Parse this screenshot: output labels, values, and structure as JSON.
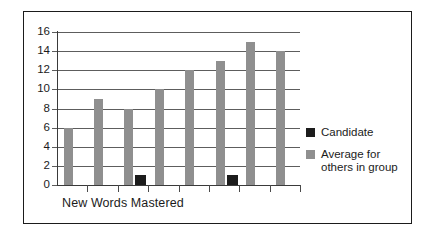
{
  "chart_data": {
    "type": "bar",
    "title": "",
    "xlabel": "New Words Mastered",
    "ylabel": "",
    "ylim": [
      0,
      16
    ],
    "ytick_labels": [
      "0",
      "2",
      "4",
      "6",
      "8",
      "10",
      "12",
      "14",
      "16"
    ],
    "ytick_values": [
      0,
      2,
      4,
      6,
      8,
      10,
      12,
      14,
      16
    ],
    "grid": true,
    "legend_position": "right",
    "categories": [
      "1",
      "2",
      "3",
      "4",
      "5",
      "6",
      "7",
      "8"
    ],
    "series": [
      {
        "name": "Candidate",
        "color": "#1c1c1c",
        "values": [
          0,
          0,
          1,
          0,
          0,
          1,
          0,
          0
        ]
      },
      {
        "name": "Average for others in group",
        "color": "#8f8f8f",
        "values": [
          6,
          9,
          8,
          10,
          12,
          13,
          15,
          14
        ]
      }
    ]
  },
  "legend": {
    "items": [
      {
        "label": "Candidate",
        "swatch": "legend-swatch-candidate"
      },
      {
        "label": "Average for\nothers in group",
        "line1": "Average for",
        "line2": "others in group",
        "swatch": "legend-swatch-average"
      }
    ]
  },
  "axis": {
    "x_title": "New Words Mastered"
  }
}
